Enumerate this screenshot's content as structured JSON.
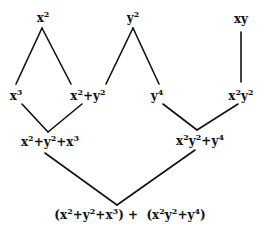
{
  "diagram": {
    "type": "polynomial-combination-tree",
    "nodes": [
      {
        "id": "x2",
        "label_html": "x<sup>2</sup>",
        "text": "x^2",
        "x": 43,
        "y": 18
      },
      {
        "id": "y2",
        "label_html": "y<sup>2</sup>",
        "text": "y^2",
        "x": 133,
        "y": 18
      },
      {
        "id": "xy",
        "label_html": "xy",
        "text": "xy",
        "x": 241,
        "y": 19
      },
      {
        "id": "x3",
        "label_html": "x<sup>3</sup>",
        "text": "x^3",
        "x": 16,
        "y": 96
      },
      {
        "id": "x2py2",
        "label_html": "x<sup>2</sup>+y<sup>2</sup>",
        "text": "x^2+y^2",
        "x": 88,
        "y": 96
      },
      {
        "id": "y4",
        "label_html": "y<sup>4</sup>",
        "text": "y^4",
        "x": 157,
        "y": 96
      },
      {
        "id": "x2y2",
        "label_html": "x<sup>2</sup>y<sup>2</sup>",
        "text": "x^2y^2",
        "x": 241,
        "y": 96
      },
      {
        "id": "sumLeft",
        "label_html": "x<sup>2</sup>+y<sup>2</sup>+x<sup>3</sup>",
        "text": "x^2+y^2+x^3",
        "x": 50,
        "y": 142
      },
      {
        "id": "sumRight",
        "label_html": "x<sup>2</sup>y<sup>2</sup>+y<sup>4</sup>",
        "text": "x^2y^2+y^4",
        "x": 200,
        "y": 141
      },
      {
        "id": "total",
        "label_html": "(x<sup>2</sup>+y<sup>2</sup>+x<sup>3</sup>) + &nbsp;(x<sup>2</sup>y<sup>2</sup>+y<sup>4</sup>)",
        "text": "(x^2+y^2+x^3) + (x^2y^2+y^4)",
        "x": 130,
        "y": 215
      }
    ],
    "edges": [
      {
        "from": "x2",
        "to": "x3",
        "x1": 42,
        "y1": 28,
        "x2": 16,
        "y2": 84
      },
      {
        "from": "x2",
        "to": "x2py2",
        "x1": 42,
        "y1": 28,
        "x2": 71,
        "y2": 84
      },
      {
        "from": "y2",
        "to": "x2py2",
        "x1": 133,
        "y1": 28,
        "x2": 106,
        "y2": 84
      },
      {
        "from": "y2",
        "to": "y4",
        "x1": 133,
        "y1": 28,
        "x2": 159,
        "y2": 84
      },
      {
        "from": "xy",
        "to": "x2y2",
        "x1": 241,
        "y1": 32,
        "x2": 241,
        "y2": 82
      },
      {
        "from": "x3",
        "to": "sumLeft",
        "x1": 22,
        "y1": 104,
        "x2": 48,
        "y2": 132
      },
      {
        "from": "x2py2",
        "to": "sumLeft",
        "x1": 82,
        "y1": 104,
        "x2": 48,
        "y2": 132
      },
      {
        "from": "y4",
        "to": "sumRight",
        "x1": 163,
        "y1": 104,
        "x2": 197,
        "y2": 130
      },
      {
        "from": "x2y2",
        "to": "sumRight",
        "x1": 238,
        "y1": 104,
        "x2": 197,
        "y2": 130
      },
      {
        "from": "sumLeft",
        "to": "total",
        "x1": 45,
        "y1": 153,
        "x2": 117,
        "y2": 205
      },
      {
        "from": "sumRight",
        "to": "total",
        "x1": 195,
        "y1": 150,
        "x2": 117,
        "y2": 205
      }
    ]
  },
  "colors": {
    "background": "#ffffff",
    "ink": "#111111"
  }
}
